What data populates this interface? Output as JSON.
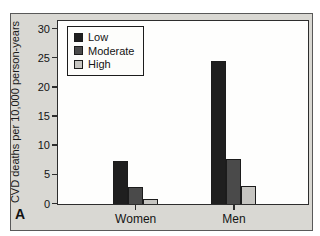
{
  "panel": {
    "label": "A"
  },
  "chart_data": {
    "type": "bar",
    "categories": [
      "Women",
      "Men"
    ],
    "series": [
      {
        "name": "Low",
        "color": "#1f1f1f",
        "values": [
          7.4,
          24.6
        ]
      },
      {
        "name": "Moderate",
        "color": "#4a4a4a",
        "values": [
          2.9,
          7.8
        ]
      },
      {
        "name": "High",
        "color": "#c6c5c1",
        "values": [
          0.8,
          3.1
        ]
      }
    ],
    "title": "",
    "xlabel": "",
    "ylabel": "CVD deaths per 10,000 person-years",
    "ylim": [
      0,
      30
    ],
    "yticks": [
      0,
      5,
      10,
      15,
      20,
      25,
      30
    ],
    "legend_position": "top-left",
    "legend_entries": [
      "Low",
      "Moderate",
      "High"
    ],
    "grid": false,
    "colors": {
      "figure_background": "#d9d8d3",
      "plot_background": "#fefefd",
      "axis": "#2d2d2d",
      "bar_outline": "#1c1c1c"
    }
  }
}
